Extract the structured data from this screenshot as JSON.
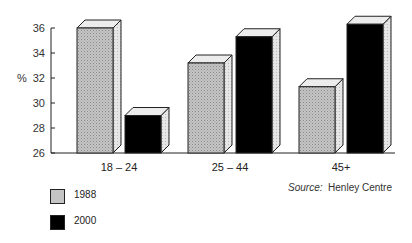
{
  "chart_data": {
    "type": "bar",
    "style": "3d-clustered",
    "title": "",
    "xlabel": "",
    "ylabel": "%",
    "ylim": [
      26,
      36
    ],
    "yticks": [
      26,
      28,
      30,
      32,
      34,
      36
    ],
    "categories": [
      "18 – 24",
      "25 – 44",
      "45+"
    ],
    "series": [
      {
        "name": "1988",
        "color": "#bdbdbd",
        "values": [
          36,
          33.2,
          31.3
        ]
      },
      {
        "name": "2000",
        "color": "#000000",
        "values": [
          29,
          35.3,
          36.3
        ]
      }
    ],
    "legend_position": "bottom-left",
    "grid": false,
    "annotation": {
      "source_label": "Source:",
      "source_value": "Henley Centre"
    }
  }
}
